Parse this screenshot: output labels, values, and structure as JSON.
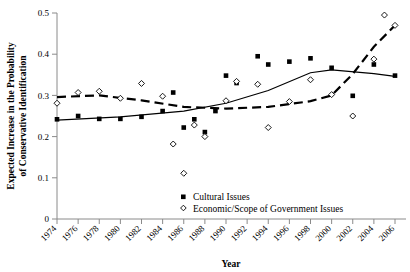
{
  "chart_data": {
    "type": "scatter",
    "title": "",
    "xlabel": "Year",
    "ylabel": "Expected Increase in the Probability of Conservative Identification",
    "xlim": [
      1973,
      2007
    ],
    "ylim": [
      0,
      0.5
    ],
    "ytick_labels": [
      "0",
      "0.1",
      "0.2",
      "0.3",
      "0.4",
      "0.5"
    ],
    "ytick_values": [
      0,
      0.1,
      0.2,
      0.3,
      0.4,
      0.5
    ],
    "xtick_labels": [
      "1974",
      "1976",
      "1978",
      "1980",
      "1982",
      "1984",
      "1986",
      "1988",
      "1990",
      "1992",
      "1994",
      "1996",
      "1998",
      "2000",
      "2002",
      "2004",
      "2006"
    ],
    "xtick_values": [
      1974,
      1976,
      1978,
      1980,
      1982,
      1984,
      1986,
      1988,
      1990,
      1992,
      1994,
      1996,
      1998,
      2000,
      2002,
      2004,
      2006
    ],
    "grid": false,
    "legend_position": "inside-lower-right",
    "series": [
      {
        "name": "Cultural Issues",
        "marker": "filled-square",
        "x": [
          1974,
          1976,
          1978,
          1980,
          1982,
          1984,
          1985,
          1986,
          1987,
          1988,
          1989,
          1990,
          1991,
          1993,
          1994,
          1996,
          1998,
          2000,
          2002,
          2004,
          2006
        ],
        "y": [
          0.242,
          0.25,
          0.243,
          0.243,
          0.248,
          0.262,
          0.307,
          0.222,
          0.242,
          0.211,
          0.262,
          0.348,
          0.33,
          0.395,
          0.375,
          0.382,
          0.39,
          0.367,
          0.299,
          0.375,
          0.348
        ]
      },
      {
        "name": "Economic/Scope of Government Issues",
        "marker": "open-diamond",
        "x": [
          1974,
          1976,
          1978,
          1980,
          1982,
          1984,
          1985,
          1986,
          1987,
          1988,
          1990,
          1991,
          1993,
          1994,
          1996,
          1998,
          2000,
          2002,
          2004,
          2005,
          2006
        ],
        "y": [
          0.281,
          0.307,
          0.31,
          0.293,
          0.329,
          0.298,
          0.182,
          0.111,
          0.228,
          0.2,
          0.287,
          0.334,
          0.327,
          0.222,
          0.285,
          0.338,
          0.302,
          0.25,
          0.388,
          0.495,
          0.47
        ]
      }
    ],
    "trend_lines": [
      {
        "name": "Cultural Issues trend",
        "style": "solid",
        "points": [
          [
            1974,
            0.24
          ],
          [
            1980,
            0.248
          ],
          [
            1986,
            0.262
          ],
          [
            1990,
            0.281
          ],
          [
            1994,
            0.312
          ],
          [
            1998,
            0.355
          ],
          [
            2000,
            0.362
          ],
          [
            2004,
            0.353
          ],
          [
            2006,
            0.346
          ]
        ]
      },
      {
        "name": "Economic/Scope of Government Issues trend",
        "style": "dashed",
        "points": [
          [
            1974,
            0.296
          ],
          [
            1978,
            0.3
          ],
          [
            1982,
            0.288
          ],
          [
            1986,
            0.272
          ],
          [
            1990,
            0.268
          ],
          [
            1994,
            0.272
          ],
          [
            1998,
            0.286
          ],
          [
            2000,
            0.3
          ],
          [
            2002,
            0.352
          ],
          [
            2004,
            0.418
          ],
          [
            2006,
            0.47
          ]
        ]
      }
    ],
    "legend": [
      {
        "label": "Cultural Issues",
        "marker": "filled-square"
      },
      {
        "label": "Economic/Scope of Government Issues",
        "marker": "open-diamond"
      }
    ]
  }
}
